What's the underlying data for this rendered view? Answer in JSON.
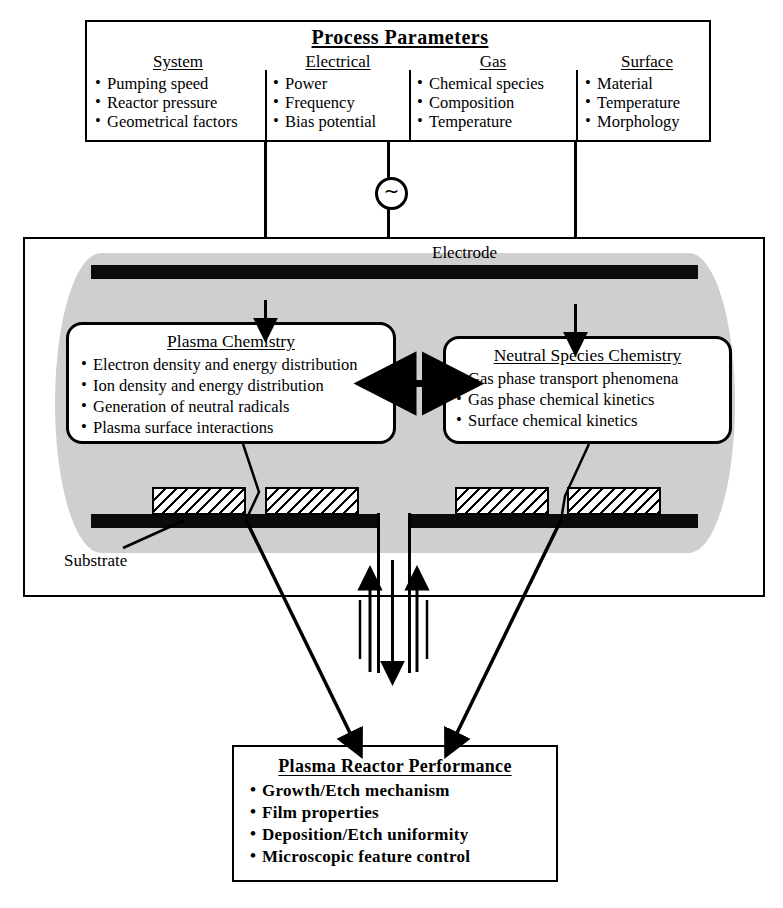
{
  "diagram": {
    "colors": {
      "ink": "#000000",
      "electrode": "#0b0b0b",
      "plasma_glow": "#cfcfcf",
      "background": "#ffffff"
    }
  },
  "process_parameters": {
    "title": "Process  Parameters",
    "columns": [
      {
        "heading": "System",
        "items": [
          "Pumping speed",
          "Reactor pressure",
          "Geometrical factors"
        ]
      },
      {
        "heading": "Electrical",
        "items": [
          "Power",
          "Frequency",
          "Bias potential"
        ]
      },
      {
        "heading": "Gas",
        "items": [
          "Chemical species",
          "Composition",
          "Temperature"
        ]
      },
      {
        "heading": "Surface",
        "items": [
          "Material",
          "Temperature",
          "Morphology"
        ]
      }
    ]
  },
  "power_source": {
    "symbol": "~",
    "name": "ac-source"
  },
  "reactor": {
    "electrode_label": "Electrode",
    "substrate_label": "Substrate",
    "plasma_chemistry": {
      "heading": "Plasma Chemistry",
      "items": [
        "Electron density and energy distribution",
        "Ion density and energy distribution",
        "Generation of neutral radicals",
        "Plasma surface interactions"
      ]
    },
    "neutral_species_chemistry": {
      "heading": "Neutral Species Chemistry",
      "items": [
        "Gas phase transport phenomena",
        "Gas phase chemical kinetics",
        "Surface chemical kinetics"
      ]
    }
  },
  "performance": {
    "title": "Plasma Reactor Performance",
    "items": [
      "Growth/Etch  mechanism",
      "Film  properties",
      "Deposition/Etch  uniformity",
      "Microscopic  feature  control"
    ]
  }
}
